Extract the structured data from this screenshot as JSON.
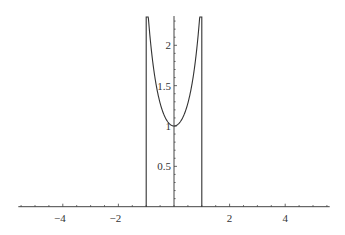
{
  "chart_data": {
    "type": "line",
    "title": "",
    "xlabel": "",
    "ylabel": "",
    "xlim": [
      -5.6,
      5.6
    ],
    "ylim": [
      0,
      2.35
    ],
    "grid": false,
    "legend": null,
    "x_ticks": [
      {
        "value": -4,
        "label": "−4"
      },
      {
        "value": -2,
        "label": "−2"
      },
      {
        "value": 2,
        "label": "2"
      },
      {
        "value": 4,
        "label": "4"
      }
    ],
    "y_ticks": [
      {
        "value": 0.5,
        "label": "0.5"
      },
      {
        "value": 1,
        "label": "1"
      },
      {
        "value": 1.5,
        "label": "1.5"
      },
      {
        "value": 2,
        "label": "2"
      }
    ],
    "series": [
      {
        "name": "f(x)",
        "description": "Piecewise: 0 for |x| >= 1, approximately exp(x^2) for |x| < 1 (clipped at top of plot range)",
        "x": [
          -5.6,
          -1.0,
          -1.0,
          -0.9,
          -0.8,
          -0.7,
          -0.6,
          -0.5,
          -0.4,
          -0.3,
          -0.2,
          -0.1,
          0.0,
          0.1,
          0.2,
          0.3,
          0.4,
          0.5,
          0.6,
          0.7,
          0.8,
          0.9,
          1.0,
          1.0,
          5.6
        ],
        "values": [
          0,
          0,
          2.35,
          2.25,
          1.9,
          1.63,
          1.43,
          1.28,
          1.17,
          1.09,
          1.04,
          1.01,
          1.0,
          1.01,
          1.04,
          1.09,
          1.17,
          1.28,
          1.43,
          1.63,
          1.9,
          2.25,
          2.35,
          0,
          0
        ]
      }
    ],
    "colors": {
      "axis": "#444444",
      "curve": "#333333",
      "text": "#333333"
    }
  },
  "caption": "Fig. — (caption text cut off at bottom edge)"
}
